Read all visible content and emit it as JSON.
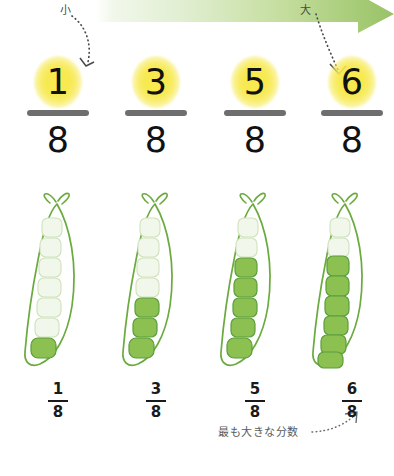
{
  "banner": {
    "label_small": "小",
    "label_large": "大",
    "color_left": "#eef5e4",
    "color_right": "#9cc46d"
  },
  "columns": [
    {
      "numerator": "1",
      "denominator": "8",
      "filled_peas": 1,
      "total_peas": 8,
      "small_numerator": "1",
      "small_denominator": "8"
    },
    {
      "numerator": "3",
      "denominator": "8",
      "filled_peas": 3,
      "total_peas": 8,
      "small_numerator": "3",
      "small_denominator": "8"
    },
    {
      "numerator": "5",
      "denominator": "8",
      "filled_peas": 5,
      "total_peas": 8,
      "small_numerator": "5",
      "small_denominator": "8"
    },
    {
      "numerator": "6",
      "denominator": "8",
      "filled_peas": 6,
      "total_peas": 8,
      "small_numerator": "6",
      "small_denominator": "8"
    }
  ],
  "caption": "最も大きな分数",
  "colors": {
    "highlight": "#f7e94f",
    "fraction_bar": "#6e6e6e",
    "pod_outline": "#6aaa3e",
    "pea_fill": "#8cc152",
    "pea_outline": "#5a9e3a",
    "empty_pea": "#eef3e6",
    "arrow_dots": "#4a4a4a"
  }
}
